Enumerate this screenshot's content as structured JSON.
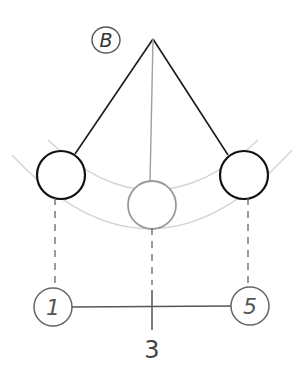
{
  "diagram": {
    "title_label": "B",
    "pivot_label": "B",
    "positions": [
      {
        "id": "left",
        "label": "1"
      },
      {
        "id": "center",
        "label": "3"
      },
      {
        "id": "right",
        "label": "5"
      }
    ],
    "colors": {
      "stroke_dark": "#1a1a1a",
      "stroke_gray": "#9a9a9a",
      "arc_light": "#d0d0d0",
      "background": "#ffffff"
    }
  }
}
